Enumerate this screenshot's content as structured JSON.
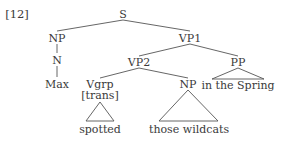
{
  "example_number": "[12]",
  "nodes": {
    "s": "S",
    "np_subject": "NP",
    "vp1": "VP1",
    "n": "N",
    "vp2": "VP2",
    "pp": "PP",
    "max": "Max",
    "vgrp": "Vgrp",
    "vgrp_feature": "[trans]",
    "np_object": "NP",
    "pp_text": "in the Spring",
    "spotted": "spotted",
    "np_object_text": "those wildcats"
  },
  "colors": {
    "text": "#3a3a3a",
    "lines": "#555555",
    "background": "#ffffff"
  }
}
